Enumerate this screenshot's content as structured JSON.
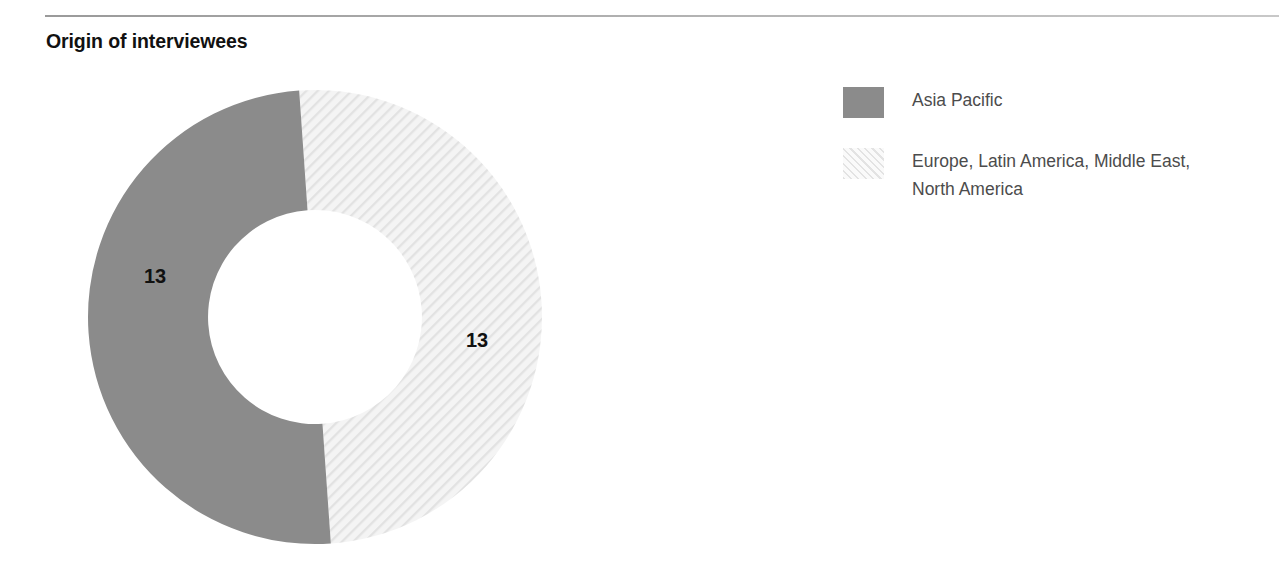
{
  "header": {
    "title": "Origin of interviewees",
    "rule_color": "#b4b4b4"
  },
  "colors": {
    "series_asia_pacific": "#8b8b8b",
    "series_rest_of_world_fill": "#f1f1f1",
    "series_rest_of_world_hatch": "#e3e3e3",
    "label_text": "#111111",
    "legend_text": "#4c4c4c",
    "background": "#ffffff"
  },
  "legend": {
    "position": "right",
    "items": [
      {
        "label": "Asia Pacific",
        "label_line1": "Asia Pacific",
        "label_line2": "",
        "swatch": "solid-gray-swatch"
      },
      {
        "label": "Europe, Latin America, Middle East, North America",
        "label_line1": "Europe, Latin America, Middle East,",
        "label_line2": "North America",
        "swatch": "hatched-light-swatch"
      }
    ]
  },
  "chart_data": {
    "type": "pie",
    "variant": "donut",
    "title": "Origin of interviewees",
    "subtitle": "",
    "xlabel": "",
    "ylabel": "",
    "legend_position": "right",
    "grid": false,
    "total": 26,
    "units": "interviewees",
    "inner_radius_ratio": 0.47,
    "categories": [
      "Asia Pacific",
      "Europe, Latin America, Middle East, North America"
    ],
    "values": [
      13,
      13
    ],
    "data_labels": [
      "13",
      "13"
    ],
    "percentages": [
      50,
      50
    ],
    "slices": [
      {
        "name": "Asia Pacific",
        "value": 13,
        "percent": 50,
        "data_label": "13",
        "fill": "solid",
        "color": "#8b8b8b",
        "start_angle_deg": 356,
        "end_angle_deg": 176,
        "direction": "counterclockwise",
        "label_x": 155,
        "label_y": 283
      },
      {
        "name": "Europe, Latin America, Middle East, North America",
        "value": 13,
        "percent": 50,
        "data_label": "13",
        "fill": "diagonal-hatch",
        "color": "#f1f1f1",
        "start_angle_deg": 356,
        "end_angle_deg": 176,
        "direction": "clockwise",
        "label_x": 477,
        "label_y": 347
      }
    ],
    "geometry": {
      "center_x": 315,
      "center_y": 317,
      "outer_radius": 227,
      "inner_radius": 107
    }
  }
}
